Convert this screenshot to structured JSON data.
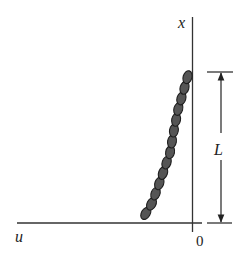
{
  "figure": {
    "labels": {
      "x_axis": "x",
      "u_axis": "u",
      "origin": "0",
      "length": "L"
    },
    "colors": {
      "chain_fill": "#555555",
      "chain_stroke": "#1e1e1e",
      "lines": "#333333"
    },
    "chain": {
      "link_count": 14,
      "top": [
        189,
        72
      ],
      "bottom": [
        143,
        218
      ]
    }
  }
}
